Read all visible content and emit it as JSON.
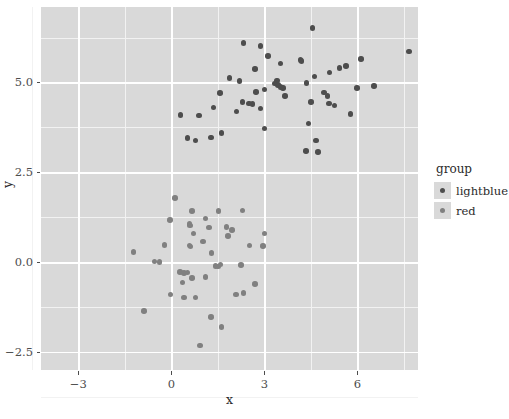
{
  "chart_data": {
    "type": "scatter",
    "title": "",
    "xlabel": "x",
    "ylabel": "y",
    "xlim": [
      -4.2,
      7.95
    ],
    "ylim": [
      -3.0,
      7.1
    ],
    "xticks": [
      -3,
      0,
      3,
      6
    ],
    "xtick_labels": [
      "−3",
      "0",
      "3",
      "6"
    ],
    "yticks": [
      -2.5,
      0.0,
      2.5,
      5.0
    ],
    "ytick_labels": [
      "−2.5",
      "0.0",
      "2.5",
      "5.0"
    ],
    "x_minor_ticks": [
      -4.5,
      -1.5,
      1.5,
      4.5,
      7.5
    ],
    "y_minor_ticks": [
      -3.75,
      -1.25,
      1.25,
      3.75,
      6.25
    ],
    "grid": true,
    "legend_position": "right",
    "legend_title": "group",
    "panel_background": "#d9d9d9",
    "gridline_color": "#ffffff",
    "series": [
      {
        "name": "lightblue",
        "color": "#4d4d4d",
        "points": [
          [
            4.55,
            6.52
          ],
          [
            2.87,
            6.02
          ],
          [
            7.66,
            5.86
          ],
          [
            2.33,
            6.1
          ],
          [
            3.12,
            5.74
          ],
          [
            6.12,
            5.66
          ],
          [
            3.52,
            5.53
          ],
          [
            4.16,
            5.62
          ],
          [
            4.2,
            5.59
          ],
          [
            2.7,
            5.38
          ],
          [
            5.1,
            5.28
          ],
          [
            5.63,
            5.46
          ],
          [
            5.42,
            5.4
          ],
          [
            3.4,
            5.06
          ],
          [
            4.62,
            5.17
          ],
          [
            4.36,
            4.99
          ],
          [
            6.53,
            4.9
          ],
          [
            1.88,
            5.12
          ],
          [
            2.2,
            5.04
          ],
          [
            3.0,
            4.8
          ],
          [
            3.35,
            4.97
          ],
          [
            3.44,
            4.93
          ],
          [
            3.52,
            4.88
          ],
          [
            3.6,
            4.84
          ],
          [
            5.98,
            4.84
          ],
          [
            1.56,
            4.7
          ],
          [
            2.73,
            4.74
          ],
          [
            4.92,
            4.72
          ],
          [
            5.03,
            4.63
          ],
          [
            3.66,
            4.62
          ],
          [
            2.3,
            4.45
          ],
          [
            2.5,
            4.42
          ],
          [
            2.62,
            4.4
          ],
          [
            4.5,
            4.45
          ],
          [
            5.08,
            4.41
          ],
          [
            5.26,
            4.36
          ],
          [
            1.36,
            4.3
          ],
          [
            2.88,
            4.28
          ],
          [
            0.3,
            4.09
          ],
          [
            0.9,
            4.08
          ],
          [
            2.1,
            4.19
          ],
          [
            5.78,
            4.12
          ],
          [
            4.42,
            3.86
          ],
          [
            3.0,
            3.72
          ],
          [
            1.62,
            3.6
          ],
          [
            0.52,
            3.45
          ],
          [
            0.78,
            3.38
          ],
          [
            1.28,
            3.47
          ],
          [
            4.66,
            3.38
          ],
          [
            4.34,
            3.1
          ],
          [
            4.72,
            3.06
          ]
        ]
      },
      {
        "name": "red",
        "color": "#808080",
        "points": [
          [
            0.12,
            1.78
          ],
          [
            0.66,
            1.42
          ],
          [
            1.52,
            1.42
          ],
          [
            2.3,
            1.44
          ],
          [
            -0.05,
            1.18
          ],
          [
            1.1,
            1.22
          ],
          [
            0.58,
            1.06
          ],
          [
            0.6,
            1.02
          ],
          [
            1.22,
            0.96
          ],
          [
            1.78,
            0.98
          ],
          [
            1.96,
            0.9
          ],
          [
            0.72,
            0.8
          ],
          [
            1.82,
            0.73
          ],
          [
            3.0,
            0.8
          ],
          [
            1.02,
            0.57
          ],
          [
            -0.22,
            0.47
          ],
          [
            0.58,
            0.46
          ],
          [
            0.62,
            0.44
          ],
          [
            2.52,
            0.46
          ],
          [
            2.96,
            0.45
          ],
          [
            -1.22,
            0.28
          ],
          [
            1.3,
            0.26
          ],
          [
            -0.54,
            0.02
          ],
          [
            -0.38,
            0.0
          ],
          [
            1.58,
            -0.06
          ],
          [
            1.42,
            -0.1
          ],
          [
            1.5,
            -0.12
          ],
          [
            2.24,
            -0.08
          ],
          [
            0.28,
            -0.28
          ],
          [
            0.4,
            -0.3
          ],
          [
            0.52,
            -0.29
          ],
          [
            0.66,
            -0.44
          ],
          [
            1.1,
            -0.42
          ],
          [
            0.36,
            -0.57
          ],
          [
            2.7,
            -0.6
          ],
          [
            -0.02,
            -0.9
          ],
          [
            0.4,
            -0.98
          ],
          [
            0.78,
            -0.98
          ],
          [
            2.08,
            -0.9
          ],
          [
            2.32,
            -0.86
          ],
          [
            -0.88,
            -1.36
          ],
          [
            1.28,
            -1.52
          ],
          [
            1.62,
            -1.8
          ],
          [
            0.92,
            -2.32
          ]
        ]
      }
    ]
  },
  "legend": {
    "title": "group",
    "entries": [
      {
        "label": "lightblue",
        "color": "#4d4d4d"
      },
      {
        "label": "red",
        "color": "#808080"
      }
    ]
  }
}
